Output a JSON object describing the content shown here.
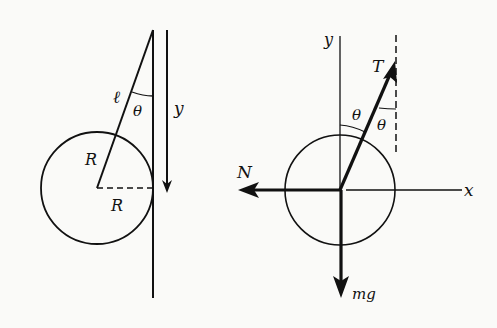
{
  "figure": {
    "left_panel": {
      "description": "Sphere hanging against a vertical wall by a string",
      "labels": {
        "string_length": "ℓ",
        "angle": "θ",
        "y_axis": "y",
        "radius_slant": "R",
        "radius_horizontal": "R"
      }
    },
    "right_panel": {
      "description": "Free-body diagram of the sphere",
      "labels": {
        "y_axis": "y",
        "x_axis": "x",
        "tension": "T",
        "normal": "N",
        "weight": "mg",
        "angle_left": "θ",
        "angle_right": "θ"
      }
    },
    "colors": {
      "ink": "#111111",
      "background": "#fafaf8"
    }
  }
}
